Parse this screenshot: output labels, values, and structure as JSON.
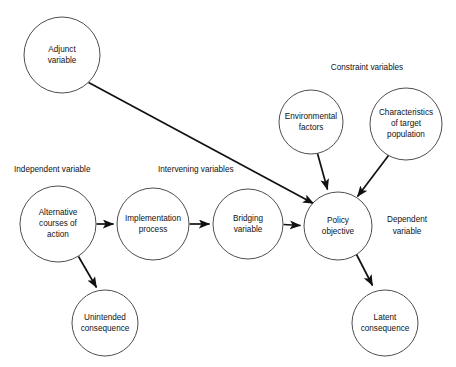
{
  "diagram": {
    "background_color": "#ffffff",
    "stroke_color": "#111111",
    "node_stroke_color": "#3a3a3a",
    "text_color": "#111111",
    "nodes": {
      "adjunct": {
        "line1": "Adjunct",
        "line2": "variable",
        "cx": 62,
        "cy": 55,
        "r": 38
      },
      "alternative": {
        "line1": "Alternative",
        "line2": "courses of",
        "line3": "action",
        "cx": 58,
        "cy": 224,
        "r": 38
      },
      "implementation": {
        "line1": "Implementation",
        "line2": "process",
        "cx": 153,
        "cy": 224,
        "r": 36
      },
      "bridging": {
        "line1": "Bridging",
        "line2": "variable",
        "cx": 248,
        "cy": 224,
        "r": 35
      },
      "policy": {
        "line1": "Policy",
        "line2": "objective",
        "cx": 338,
        "cy": 226,
        "r": 34
      },
      "environmental": {
        "line1": "Environmental",
        "line2": "factors",
        "cx": 311,
        "cy": 122,
        "r": 32
      },
      "characteristics": {
        "line1": "Characteristics",
        "line2": "of target",
        "line3": "population",
        "cx": 406,
        "cy": 124,
        "r": 36
      },
      "unintended": {
        "line1": "Unintended",
        "line2": "consequence",
        "cx": 105,
        "cy": 323,
        "r": 33
      },
      "latent": {
        "line1": "Latent",
        "line2": "consequence",
        "cx": 385,
        "cy": 323,
        "r": 33
      }
    },
    "group_labels": {
      "constraint": {
        "text": "Constraint variables",
        "x": 367,
        "y": 70
      },
      "independent": {
        "text": "Independent variable",
        "x": 14,
        "y": 172
      },
      "intervening": {
        "text": "Intervening variables",
        "x": 158,
        "y": 172
      },
      "dependent_line1": {
        "text": "Dependent",
        "x": 407,
        "y": 222
      },
      "dependent_line2": {
        "text": "variable",
        "x": 407,
        "y": 234
      }
    },
    "edges": [
      {
        "name": "adjunct-to-policy",
        "from": "adjunct",
        "to": "policy",
        "arrow": true
      },
      {
        "name": "alternative-to-implementation",
        "from": "alternative",
        "to": "implementation",
        "arrow": true
      },
      {
        "name": "implementation-to-bridging",
        "from": "implementation",
        "to": "bridging",
        "arrow": true
      },
      {
        "name": "bridging-to-policy",
        "from": "bridging",
        "to": "policy",
        "arrow": true
      },
      {
        "name": "alternative-to-unintended",
        "from": "alternative",
        "to": "unintended",
        "arrow": true
      },
      {
        "name": "environmental-to-policy",
        "from": "environmental",
        "to": "policy",
        "arrow": true
      },
      {
        "name": "characteristics-to-policy",
        "from": "characteristics",
        "to": "policy",
        "arrow": true
      },
      {
        "name": "policy-to-latent",
        "from": "policy",
        "to": "latent",
        "arrow": true
      }
    ]
  }
}
